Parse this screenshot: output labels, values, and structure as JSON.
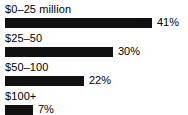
{
  "chart_data": {
    "type": "bar",
    "orientation": "horizontal",
    "title": "",
    "subtitle": "",
    "xlabel": "",
    "ylabel": "",
    "grid": false,
    "legend": false,
    "axis_visible": false,
    "xlim": [
      0,
      52
    ],
    "value_suffix": "%",
    "bar_color": "#111111",
    "background_color": "#ffffff",
    "categories": [
      "$0–25 million",
      "$25–50",
      "$50–100",
      "$100+"
    ],
    "values": [
      41,
      30,
      22,
      7
    ],
    "value_labels": [
      "41%",
      "30%",
      "22%",
      "7%"
    ],
    "bars": [
      {
        "label": "$0–25 million",
        "value": 41,
        "value_label": "41%",
        "width_px": 147
      },
      {
        "label": "$25–50",
        "value": 30,
        "value_label": "30%",
        "width_px": 108
      },
      {
        "label": "$50–100",
        "value": 22,
        "value_label": "22%",
        "width_px": 79
      },
      {
        "label": "$100+",
        "value": 7,
        "value_label": "7%",
        "width_px": 28
      }
    ]
  }
}
